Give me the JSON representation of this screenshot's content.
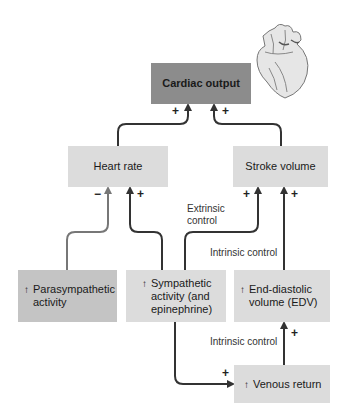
{
  "nodes": {
    "cardiac_output": "Cardiac output",
    "heart_rate": "Heart rate",
    "stroke_volume": "Stroke volume",
    "parasympathetic": {
      "arrow": "↑",
      "lines": [
        "Parasympathetic",
        "activity"
      ]
    },
    "sympathetic": {
      "arrow": "↑",
      "lines": [
        "Sympathetic",
        "activity (and",
        "epinephrine)"
      ]
    },
    "edv": {
      "arrow": "↑",
      "lines": [
        "End-diastolic",
        "volume (EDV)"
      ]
    },
    "venous_return": {
      "arrow": "↑",
      "text": "Venous return"
    }
  },
  "labels": {
    "extrinsic_1": "Extrinsic",
    "extrinsic_2": "control",
    "intrinsic_upper": "Intrinsic control",
    "intrinsic_lower": "Intrinsic control"
  },
  "signs": {
    "co_left": "+",
    "co_right": "+",
    "hr_minus": "−",
    "hr_plus": "+",
    "sv_left": "+",
    "sv_right": "+",
    "edv_plus": "+",
    "venous_plus": "+"
  },
  "colors": {
    "cardiac_box": "#8c8c8c",
    "primary_box": "#dcdcdc",
    "source_box": "#c4c4c4",
    "arrow_dark": "#333333",
    "arrow_gray": "#777777"
  }
}
